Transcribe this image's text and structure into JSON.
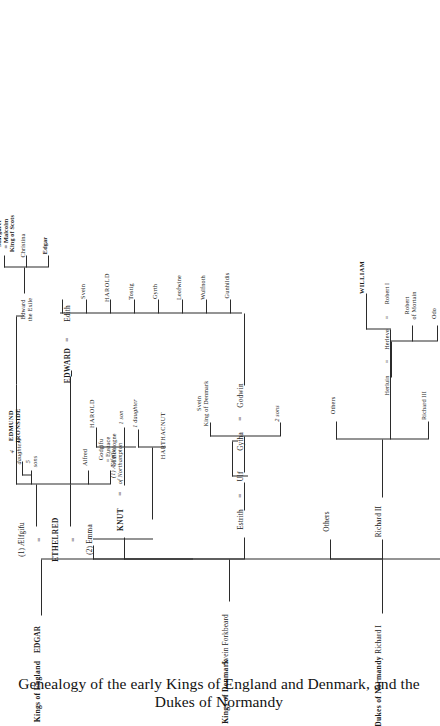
{
  "caption": "Genealogy of the early Kings of England and Denmark, and the Dukes of Normandy",
  "headers": {
    "england": "Kings of England",
    "denmark": "Kings of Denmark",
    "normandy": "Dukes of Normandy"
  },
  "england": {
    "edgar": "EDGAR",
    "aelfgifu": "(1) Ælfgifu",
    "ethelred": "ETHELRED",
    "emma": "(2) Emma",
    "five_sons": "5\nsons",
    "four_daughters": "4\ndaughters",
    "edmund": "EDMUND\nIRONSIDE",
    "alfred": "Alfred",
    "godgifu": "Godgifu\n= Eustace\nof Boulogne",
    "edward": "EDWARD",
    "edith": "Edith",
    "edward_exile": "Edward\nthe Exile",
    "margaret": "Margaret\n= Malcolm\nKing of Scots",
    "christina": "Christina",
    "edgar_atheling": "Edgar"
  },
  "denmark": {
    "svein_forkbeard": "Svein Forkbeard",
    "knut": "KNUT",
    "aelfgifu_northampton": "(1) Ælfgifu\nof Northampton",
    "harold": "HAROLD",
    "one_son": "1 son",
    "one_daughter": "1 daughter",
    "harthacnut": "HARTHACNUT",
    "estrith": "Estrith",
    "ulf": "Ulf",
    "two_sons": "2 sons",
    "svein_denmark": "Svein\nKing of Denmark",
    "gytha": "Gytha",
    "godwin": "Godwin"
  },
  "godwin_children": [
    "Edith",
    "Svein",
    "HAROLD",
    "Tostig",
    "Gyrth",
    "Leofwine",
    "Wulfnoth",
    "Gunhildis"
  ],
  "normandy": {
    "richard_i": "Richard I",
    "richard_ii": "Richard II",
    "others_1": "Others",
    "richard_iii": "Richard III",
    "others_2": "Others",
    "herluin": "Herluin",
    "herleve": "Herleve",
    "robert_i": "Robert I",
    "odo": "Odo",
    "robert_mortain": "Robert\nof Mortain",
    "william": "WILLIAM"
  },
  "marriage_sign": "=",
  "colors": {
    "ink": "#2b2b2b",
    "paper": "#ffffff"
  }
}
